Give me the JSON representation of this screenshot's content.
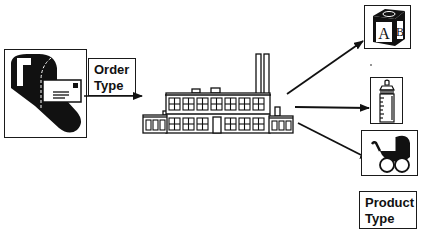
{
  "diagram": {
    "input_label": {
      "line1": "Order",
      "line2": "Type"
    },
    "output_label": {
      "line1": "Product",
      "line2": "Type"
    },
    "nodes": [
      {
        "id": "mailbox",
        "icon": "mailbox-icon",
        "role": "input"
      },
      {
        "id": "factory",
        "icon": "factory-icon",
        "role": "process"
      },
      {
        "id": "toy-block",
        "icon": "abc-block-icon",
        "role": "output",
        "block_letters": [
          "A",
          "B"
        ]
      },
      {
        "id": "baby-bottle",
        "icon": "baby-bottle-icon",
        "role": "output"
      },
      {
        "id": "baby-carriage",
        "icon": "baby-carriage-icon",
        "role": "output"
      }
    ],
    "edges": [
      {
        "from": "mailbox",
        "to": "factory"
      },
      {
        "from": "factory",
        "to": "toy-block"
      },
      {
        "from": "factory",
        "to": "baby-bottle"
      },
      {
        "from": "factory",
        "to": "baby-carriage"
      }
    ],
    "colors": {
      "ink": "#111111",
      "background": "#ffffff"
    }
  }
}
